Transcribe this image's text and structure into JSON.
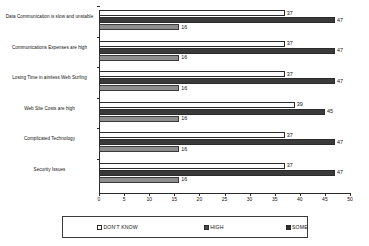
{
  "chart_data": {
    "type": "bar",
    "orientation": "horizontal",
    "title": "",
    "xlabel": "",
    "ylabel": "",
    "xlim": [
      0,
      50
    ],
    "xticks": [
      0,
      5,
      10,
      15,
      20,
      25,
      30,
      35,
      40,
      45,
      50
    ],
    "grid": false,
    "legend_position": "bottom",
    "categories": [
      "Data Communication is slow and unstable",
      "Communications Expenses are high",
      "Losing Time in aimless Web Surfing",
      "Web Site Costs are high",
      "Complicated Technology",
      "Security Issues"
    ],
    "series": [
      {
        "name": "DON'T KNOW",
        "color": "#fdfdfd",
        "values": [
          37,
          37,
          37,
          39,
          37,
          37
        ]
      },
      {
        "name": "HIGH",
        "color": "#3a3a3a",
        "values": [
          47,
          47,
          47,
          45,
          47,
          47
        ]
      },
      {
        "name": "SOME",
        "color": "#8e8e8e",
        "values": [
          16,
          16,
          16,
          16,
          16,
          16
        ]
      }
    ]
  },
  "legend": {
    "entries": [
      {
        "label": "DON'T KNOW"
      },
      {
        "label": "HIGH"
      },
      {
        "label": "SOME"
      }
    ]
  }
}
